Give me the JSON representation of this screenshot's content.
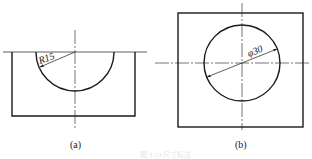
{
  "figure": {
    "panels": [
      {
        "id": "a",
        "label": "(a)",
        "dimension": "R15",
        "description": "Rectangular block with semicircular cutout at top edge"
      },
      {
        "id": "b",
        "label": "(b)",
        "dimension": "φ30",
        "description": "Square plate with central circular hole"
      }
    ],
    "caption": "图 3-13 尺寸标注"
  },
  "colors": {
    "line": "#1a1a1a",
    "background": "#ffffff"
  }
}
